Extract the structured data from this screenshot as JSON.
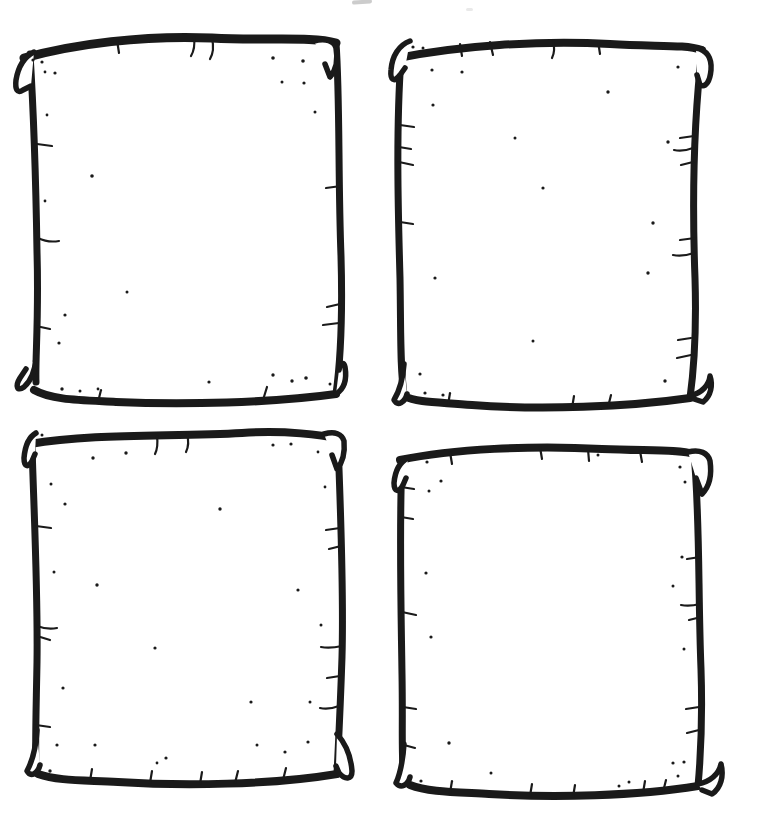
{
  "artwork": {
    "kind": "hand-drawn blank doodle frames",
    "layout": "2x2 grid",
    "frame_count": 4,
    "frames": [
      {
        "name": "frame-top-left",
        "content": ""
      },
      {
        "name": "frame-top-right",
        "content": ""
      },
      {
        "name": "frame-bottom-left",
        "content": ""
      },
      {
        "name": "frame-bottom-right",
        "content": ""
      }
    ]
  },
  "colors": {
    "ink": "#1a1a1a",
    "paper": "#ffffff",
    "smudge": "#9a9a9a"
  }
}
